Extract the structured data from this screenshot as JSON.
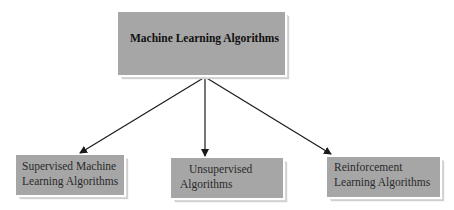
{
  "diagram": {
    "root": {
      "label": "Machine Learning Algorithms"
    },
    "children": [
      {
        "lines": [
          "Supervised Machine",
          "Learning Algorithms"
        ]
      },
      {
        "lines": [
          "Unsupervised",
          "Algorithms"
        ]
      },
      {
        "lines": [
          "Reinforcement",
          "Learning Algorithms"
        ]
      }
    ],
    "colors": {
      "box_fill": "#a6a6a6",
      "arrow": "#1a1a1a",
      "text": "#111111"
    }
  }
}
